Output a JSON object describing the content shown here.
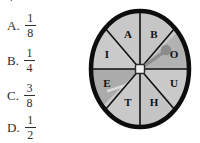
{
  "question": {
    "top_fragment": "r",
    "choices": [
      {
        "label": "A.",
        "numerator": "1",
        "denominator": "8"
      },
      {
        "label": "B.",
        "numerator": "1",
        "denominator": "4"
      },
      {
        "label": "C.",
        "numerator": "3",
        "denominator": "8"
      },
      {
        "label": "D.",
        "numerator": "1",
        "denominator": "2"
      }
    ]
  },
  "spinner": {
    "sector_count": 8,
    "sectors": [
      {
        "letter": "A",
        "shade": "#c8c8c8"
      },
      {
        "letter": "B",
        "shade": "#c6c6c6"
      },
      {
        "letter": "O",
        "shade": "#b2b2b2"
      },
      {
        "letter": "U",
        "shade": "#c9c9c9"
      },
      {
        "letter": "H",
        "shade": "#c4c4c4"
      },
      {
        "letter": "T",
        "shade": "#c9c9c9"
      },
      {
        "letter": "E",
        "shade": "#ababab"
      },
      {
        "letter": "I",
        "shade": "#cacaca"
      }
    ],
    "pointer_target_letter": "O",
    "colors": {
      "rim": "#0d0d0d",
      "divider": "#111111",
      "hub": "#efefef",
      "hub_border": "#2a2a2a",
      "pointer": "#8c8c8c",
      "background": "#ffffff"
    }
  }
}
